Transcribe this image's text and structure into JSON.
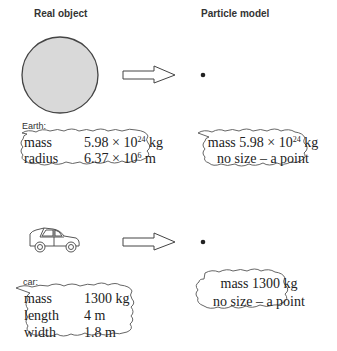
{
  "headers": {
    "left": "Real object",
    "right": "Particle model"
  },
  "earth": {
    "label": "Earth:",
    "real": {
      "rows": [
        {
          "name": "mass",
          "value": "5.98 × 10",
          "exp": "24",
          "unit": " kg"
        },
        {
          "name": "radius",
          "value": "6.37 × 10",
          "exp": "6",
          "unit": " m"
        }
      ]
    },
    "model": {
      "line1_prefix": "mass 5.98 × 10",
      "line1_exp": "24",
      "line1_suffix": " kg",
      "line2": "no size – a point"
    }
  },
  "car": {
    "label": "car:",
    "real": {
      "rows": [
        {
          "name": "mass",
          "value": "1300 kg"
        },
        {
          "name": "length",
          "value": "4 m"
        },
        {
          "name": "width",
          "value": "1.8 m"
        }
      ]
    },
    "model": {
      "line1": "mass 1300 kg",
      "line2": "no size – a point"
    }
  },
  "colors": {
    "earth_fill": "#d9d9d9",
    "stroke": "#444444"
  }
}
